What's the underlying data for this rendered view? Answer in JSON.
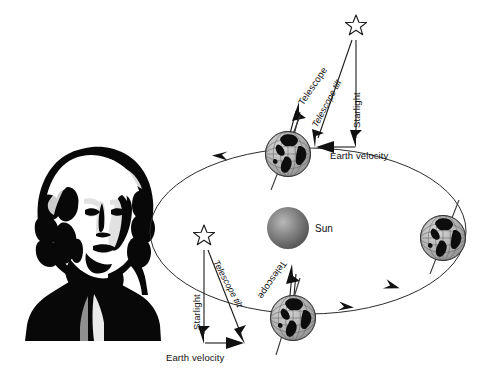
{
  "figure": {
    "background_color": "#ffffff",
    "ink_color": "#111111"
  },
  "portrait": {
    "name": "astronomer-portrait",
    "description": "High-contrast black and white engraved bust portrait of a bewigged 18th century astronomer",
    "bounds": {
      "x": 18,
      "y": 143,
      "width": 150,
      "height": 200
    }
  },
  "sun": {
    "label": "Sun",
    "color": "#6f6f6f",
    "highlight_color": "#b4b4b4",
    "center": {
      "x": 288,
      "y": 228
    },
    "radius": 21
  },
  "orbit": {
    "name": "earth-orbit-ellipse",
    "center": {
      "x": 308,
      "y": 231
    },
    "rx": 158,
    "ry": 83,
    "direction": "counterclockwise",
    "arrow_count": 3
  },
  "earths": [
    {
      "id": "earth-top",
      "label": "",
      "center": {
        "x": 288,
        "y": 154
      },
      "radius": 26
    },
    {
      "id": "earth-right",
      "label": "",
      "center": {
        "x": 443,
        "y": 238
      },
      "radius": 26
    },
    {
      "id": "earth-bottom",
      "label": "",
      "center": {
        "x": 293,
        "y": 318
      },
      "radius": 26
    }
  ],
  "stars": [
    {
      "id": "star-upper",
      "center": {
        "x": 356,
        "y": 26
      }
    },
    {
      "id": "star-lower",
      "center": {
        "x": 204,
        "y": 236
      }
    }
  ],
  "annotations_upper": {
    "telescope": "Telescope",
    "telescope_tilt": "Telescope tilt",
    "starlight": "Starlight",
    "earth_velocity": "Earth velocity",
    "velocity_direction": "left"
  },
  "annotations_lower": {
    "telescope": "Telescope",
    "telescope_tilt": "Telescope tilt",
    "starlight": "Starlight",
    "earth_velocity": "Earth velocity",
    "velocity_direction": "right"
  }
}
